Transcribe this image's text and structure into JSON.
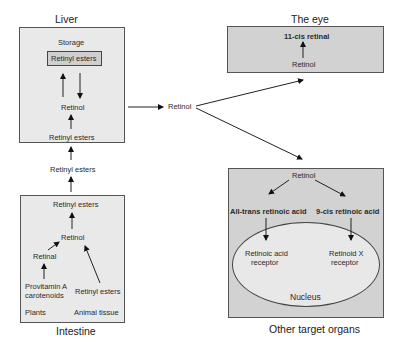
{
  "liver": {
    "title": "Liver",
    "storage_label": "Storage",
    "storage_box": "Retinyl esters",
    "retinol": "Retinol",
    "retinyl_esters": "Retinyl esters"
  },
  "transport": {
    "retinyl_esters": "Retinyl esters",
    "retinol": "Retinol"
  },
  "intestine": {
    "title": "Intestine",
    "retinyl_esters_top": "Retinyl esters",
    "retinol": "Retinol",
    "retinal": "Retinal",
    "provitamin_line1": "Provitamin  A",
    "provitamin_line2": "carotenoids",
    "retinyl_esters_bottom": "Retinyl esters",
    "plants": "Plants",
    "animal_tissue": "Animal tissue"
  },
  "eye": {
    "title": "The eye",
    "product": "11-cis retinal",
    "retinol": "Retinol"
  },
  "other_organs": {
    "title": "Other target organs",
    "retinol": "Retinol",
    "all_trans": "All-trans retinoic acid",
    "nine_cis": "9-cis retinoic acid",
    "rar_line1": "Retinoic acid",
    "rar_line2": "receptor",
    "rxr_line1": "Retinoid  X",
    "rxr_line2": "receptor",
    "nucleus": "Nucleus"
  },
  "colors": {
    "light_box": "#e9e9e9",
    "dark_box": "#d2d2d2",
    "stroke": "#555555"
  }
}
